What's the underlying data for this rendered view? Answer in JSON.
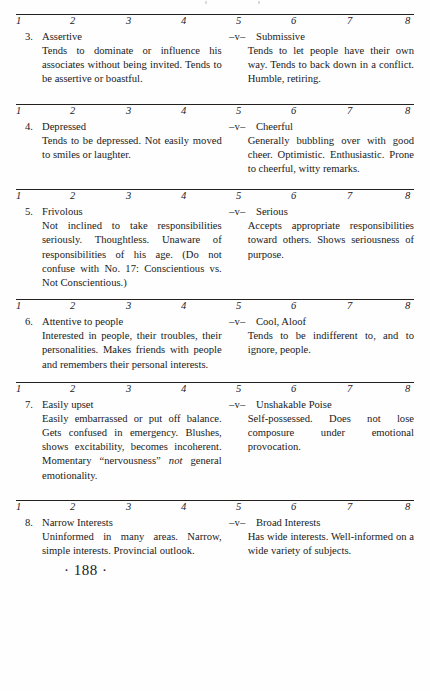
{
  "page": {
    "number_label": "· 188 ·",
    "background_color": "#fefefe",
    "ink_color": "#1a1a1a",
    "rule_color": "#23201e"
  },
  "scale": {
    "ticks": [
      "1",
      "2",
      "3",
      "4",
      "5",
      "6",
      "7",
      "8"
    ]
  },
  "separator": "–v–",
  "items": [
    {
      "number": "3.",
      "left_pole": "Assertive",
      "right_pole": "Submissive",
      "left_text": "Tends to dominate or influence his associates without being invited. Tends to be assertive or boastful.",
      "right_text": "Tends to let people have their own way. Tends to back down in a conflict. Humble, retiring."
    },
    {
      "number": "4.",
      "left_pole": "Depressed",
      "right_pole": "Cheerful",
      "left_text": "Tends to be depressed. Not easily moved to smiles or laughter.",
      "right_text": "Generally bubbling over with good cheer. Optimistic. Enthusiastic. Prone to cheerful, witty remarks."
    },
    {
      "number": "5.",
      "left_pole": "Frivolous",
      "right_pole": "Serious",
      "left_text": "Not inclined to take responsibilities seriously. Thoughtless. Unaware of responsibilities of his age. (Do not confuse with No. 17: Conscientious vs. Not Conscientious.)",
      "right_text": "Accepts appropriate responsibilities toward others. Shows seriousness of purpose."
    },
    {
      "number": "6.",
      "left_pole": "Attentive to people",
      "right_pole": "Cool, Aloof",
      "left_text": "Interested in people, their troubles, their personalities. Makes friends with people and remembers their personal interests.",
      "right_text": "Tends to be indifferent to, and to ignore, people."
    },
    {
      "number": "7.",
      "left_pole": "Easily upset",
      "right_pole": "Unshakable Poise",
      "left_text_part1": "Easily embarrassed or put off balance. Gets confused in emergency. Blushes, shows excitability, becomes incoherent. Momentary “nervousness” ",
      "left_text_italic": "not",
      "left_text_part2": " general emotionality.",
      "right_text": "Self-possessed. Does not lose composure under emotional provocation."
    },
    {
      "number": "8.",
      "left_pole": "Narrow Interests",
      "right_pole": "Broad Interests",
      "left_text": "Uninformed in many areas. Narrow, simple interests. Provincial outlook.",
      "right_text": "Has wide interests. Well-informed on a wide variety of subjects."
    }
  ]
}
